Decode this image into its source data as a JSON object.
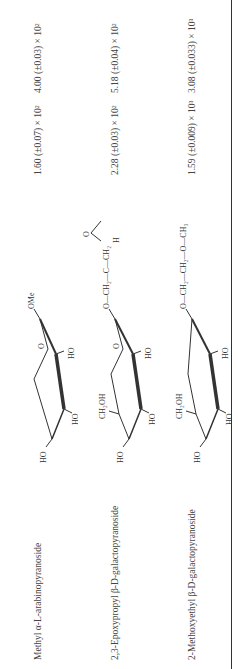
{
  "table": {
    "rows": [
      {
        "compound": "Methyl α-L-arabinopyranoside",
        "structure": {
          "aglycone": "OMe",
          "substituents": [
            "HO",
            "HO",
            "HO",
            "O"
          ]
        },
        "value_1": "1.60 (±0.07) × 10²",
        "value_2": "4.00 (±0.03) × 10²"
      },
      {
        "compound": "2,3-Epoxypropyl β-D-galactopyranoside",
        "structure": {
          "aglycone": "O—CH₂—C—CH₂",
          "epoxide_o": "O",
          "epoxide_h": "H",
          "substituents": [
            "HO",
            "HO",
            "HO",
            "CH₂OH",
            "O"
          ]
        },
        "value_1": "2.28 (±0.03) × 10²",
        "value_2": "5.18 (±0.04) × 10²"
      },
      {
        "compound": "2-Methoxyethyl β-D-galactopyranoside",
        "structure": {
          "aglycone": "O—CH₂—CH₂—O—CH₃",
          "substituents": [
            "HO",
            "HO",
            "HO",
            "CH₂OH"
          ]
        },
        "value_1": "1.59 (±0.009) × 10³",
        "value_2": "3.08 (±0.033) × 10³"
      }
    ]
  }
}
